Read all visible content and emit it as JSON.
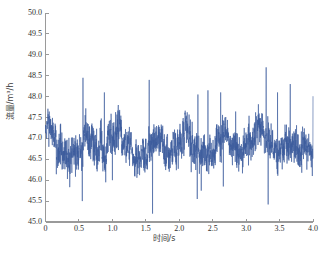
{
  "chart_data": {
    "type": "line",
    "title": "",
    "xlabel": "时间/s",
    "ylabel": "流量/m³/h",
    "xlim": [
      0,
      4.0
    ],
    "ylim": [
      45.0,
      50.0
    ],
    "xticks": [
      "0",
      "0.5",
      "1.0",
      "1.5",
      "2.0",
      "2.5",
      "3.0",
      "3.5",
      "4.0"
    ],
    "xtick_values": [
      0,
      0.5,
      1.0,
      1.5,
      2.0,
      2.5,
      3.0,
      3.5,
      4.0
    ],
    "yticks": [
      "45.0",
      "45.5",
      "46.0",
      "46.5",
      "47.0",
      "47.5",
      "48.0",
      "48.5",
      "49.0",
      "49.5",
      "50.0"
    ],
    "ytick_values": [
      45.0,
      45.5,
      46.0,
      46.5,
      47.0,
      47.5,
      48.0,
      48.5,
      49.0,
      49.5,
      50.0
    ],
    "grid": false,
    "legend": null,
    "series": [
      {
        "name": "流量",
        "color": "#3a5b9c",
        "line_width": 0.6,
        "mean_level": 46.85,
        "noise_amplitude": 0.33,
        "envelope_period_s": 0.52,
        "envelope_amplitude": 0.32,
        "sample_count": 2000,
        "envelope_peaks_x": [
          0.42,
          0.68,
          1.35,
          1.58,
          2.05,
          2.42,
          2.62,
          3.35,
          3.66
        ],
        "envelope_troughs_x": [
          0.18,
          0.98,
          1.22,
          1.78,
          2.22,
          2.95,
          3.18,
          3.9
        ],
        "upward_spikes": [
          {
            "x": 0.56,
            "y": 48.45
          },
          {
            "x": 0.88,
            "y": 48.1
          },
          {
            "x": 1.55,
            "y": 48.4
          },
          {
            "x": 1.6,
            "y": 49.5
          },
          {
            "x": 2.28,
            "y": 48.05
          },
          {
            "x": 2.43,
            "y": 48.15
          },
          {
            "x": 2.62,
            "y": 48.1
          },
          {
            "x": 3.3,
            "y": 48.7
          },
          {
            "x": 3.33,
            "y": 49.38
          },
          {
            "x": 3.47,
            "y": 48.1
          },
          {
            "x": 3.66,
            "y": 48.3
          },
          {
            "x": 4.0,
            "y": 48.0
          }
        ],
        "downward_spikes": [
          {
            "x": 0.55,
            "y": 45.5
          },
          {
            "x": 0.9,
            "y": 45.95
          },
          {
            "x": 1.0,
            "y": 46.0
          },
          {
            "x": 1.6,
            "y": 45.2
          },
          {
            "x": 2.27,
            "y": 45.55
          },
          {
            "x": 2.33,
            "y": 45.75
          },
          {
            "x": 2.66,
            "y": 45.85
          },
          {
            "x": 3.33,
            "y": 45.42
          },
          {
            "x": 3.99,
            "y": 46.1
          }
        ],
        "y_min_observed": 45.2,
        "y_max_observed": 49.5
      }
    ],
    "style": {
      "background": "#ffffff",
      "axis_color": "#9a9a9a",
      "tick_label_color": "#2f2f2f",
      "spines": [
        "left",
        "bottom"
      ],
      "tick_direction": "in"
    }
  },
  "caption": {
    "text": ""
  }
}
